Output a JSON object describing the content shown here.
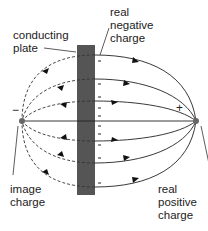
{
  "labels": {
    "conducting_plate": "conducting\nplate",
    "real_negative_charge": "real\nnegative\ncharge",
    "image_charge": "image\ncharge",
    "real_positive_charge": "real\npositive\ncharge"
  },
  "charges": {
    "image_sign": "−",
    "real_sign": "+"
  },
  "colors": {
    "plate": "#555555",
    "line": "#222222",
    "charge_dot": "#666666"
  },
  "surface_charges": [
    "-",
    "-",
    "-",
    "-",
    "-",
    "-",
    "-",
    "-",
    "-",
    "-",
    "-",
    "-",
    "-",
    "-"
  ]
}
